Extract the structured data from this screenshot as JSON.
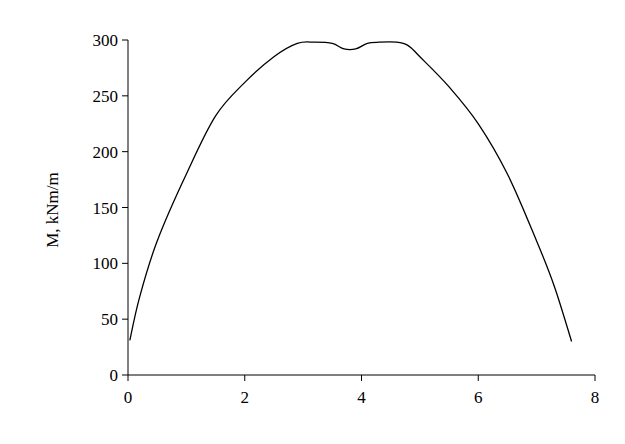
{
  "chart_data": {
    "type": "line",
    "title": "",
    "xlabel": "",
    "ylabel": "M, kNm/m",
    "xlim": [
      0,
      8
    ],
    "ylim": [
      0,
      300
    ],
    "x_ticks": [
      0,
      2,
      4,
      6,
      8
    ],
    "y_ticks": [
      0,
      50,
      100,
      150,
      200,
      250,
      300
    ],
    "grid": false,
    "legend": null,
    "series": [
      {
        "name": "M",
        "color": "#000000",
        "x": [
          0.03,
          0.2,
          0.5,
          1.0,
          1.5,
          2.0,
          2.5,
          2.9,
          3.2,
          3.5,
          3.7,
          3.9,
          4.1,
          4.3,
          4.6,
          4.8,
          5.0,
          5.5,
          6.0,
          6.5,
          7.0,
          7.3,
          7.6
        ],
        "values": [
          31,
          70,
          120,
          180,
          232,
          262,
          285,
          297,
          298,
          297,
          292,
          292,
          297,
          298,
          298,
          295,
          285,
          258,
          225,
          180,
          120,
          80,
          30
        ]
      }
    ]
  }
}
